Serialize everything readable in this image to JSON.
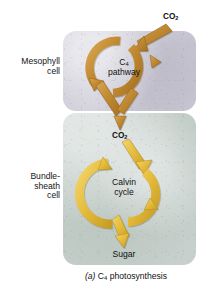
{
  "figure": {
    "caption_prefix": "(a)",
    "caption_main_before_sub": " C",
    "caption_sub": "4",
    "caption_main_after_sub": " photosynthesis",
    "caption_full": "(a) C4 photosynthesis"
  },
  "labels": {
    "mesophyll_cell": "Mesophyll\ncell",
    "bundle_sheath_cell": "Bundle-\nsheath\ncell",
    "co2_top_text": "CO",
    "co2_top_sub": "2",
    "co2_mid_text": "CO",
    "co2_mid_sub": "2",
    "c4_pathway_line1_text": "C",
    "c4_pathway_line1_sub": "4",
    "c4_pathway_line2": "pathway",
    "calvin_cycle_line1": "Calvin",
    "calvin_cycle_line2": "cycle",
    "sugar": "Sugar"
  },
  "compartments": {
    "mesophyll": {
      "name": "Mesophyll cell",
      "fill_color": "#cdcbd7"
    },
    "bundle_sheath": {
      "name": "Bundle-sheath cell",
      "fill_color": "#c3cdc8"
    }
  },
  "cycles": {
    "c4_pathway": {
      "name": "C4 pathway",
      "arrow_color": "#c08a33",
      "arrow_color_light": "#d9a54e",
      "arrow_color_dark": "#9a6a20",
      "direction": "clockwise"
    },
    "calvin_cycle": {
      "name": "Calvin cycle",
      "arrow_color": "#e8bf3e",
      "arrow_color_light": "#f0d066",
      "arrow_color_dark": "#bb9520",
      "direction": "clockwise"
    }
  },
  "flow": {
    "input_top": "CO2 enters mesophyll cell",
    "transfer": "CO2 passes to bundle-sheath cell",
    "output_bottom": "Sugar"
  },
  "colors": {
    "page_background": "#ffffff",
    "text": "#161616"
  }
}
